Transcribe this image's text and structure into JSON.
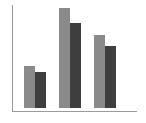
{
  "chart_data": {
    "type": "bar",
    "title": "",
    "xlabel": "",
    "ylabel": "",
    "categories": [
      "",
      "",
      ""
    ],
    "series": [
      {
        "name": "Series 1",
        "color": "#8a8a8a",
        "values": [
          42,
          100,
          73
        ]
      },
      {
        "name": "Series 2",
        "color": "#3e3e3e",
        "values": [
          36,
          85,
          62
        ]
      }
    ],
    "ylim": [
      0,
      100
    ],
    "grid": false,
    "legend": false
  },
  "layout": {
    "plot_bottom_px": 108,
    "plot_height_px": 100,
    "bar_width_px": 11,
    "group_starts_px": [
      24,
      59,
      94
    ]
  }
}
